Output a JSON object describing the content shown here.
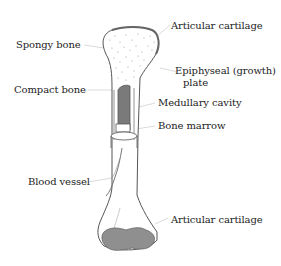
{
  "diagram": {
    "labels": {
      "articular_cartilage_top": "Articular cartilage",
      "spongy_bone": "Spongy bone",
      "epiphyseal_plate_line1": "Epiphyseal (growth)",
      "epiphyseal_plate_line2": "plate",
      "compact_bone": "Compact bone",
      "medullary_cavity": "Medullary cavity",
      "bone_marrow": "Bone marrow",
      "blood_vessel": "Blood vessel",
      "articular_cartilage_bottom": "Articular cartilage"
    },
    "colors": {
      "outline": "#555555",
      "leader_line": "#cccccc",
      "cartilage": "#9a9a9a",
      "marrow": "#8a8a8a",
      "text": "#222222"
    }
  }
}
